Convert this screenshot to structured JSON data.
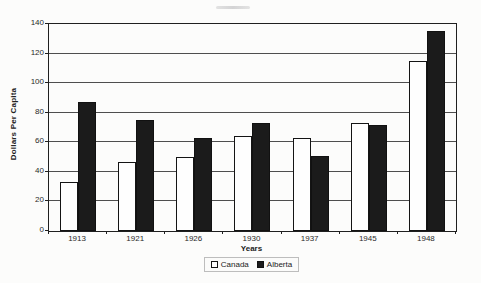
{
  "chart_data": {
    "type": "bar",
    "title": "",
    "categories": [
      "1913",
      "1921",
      "1926",
      "1930",
      "1937",
      "1945",
      "1948"
    ],
    "series": [
      {
        "name": "Canada",
        "color": "#fefefe",
        "values": [
          33,
          47,
          50,
          64,
          63,
          73,
          115
        ]
      },
      {
        "name": "Alberta",
        "color": "#1b1b1b",
        "values": [
          87,
          75,
          63,
          73,
          51,
          72,
          135
        ]
      }
    ],
    "xlabel": "Years",
    "ylabel": "Dollars Per Capita",
    "ylim": [
      0,
      140
    ],
    "yticks": [
      0,
      20,
      40,
      60,
      80,
      100,
      120,
      140
    ],
    "grid": true,
    "legend_position": "bottom"
  },
  "colors": {
    "axis": "#1f1f1f",
    "gridline": "#4e4e4e",
    "background": "#fcfcfb",
    "bar_canada": "#fefefe",
    "bar_alberta": "#1b1b1b"
  }
}
